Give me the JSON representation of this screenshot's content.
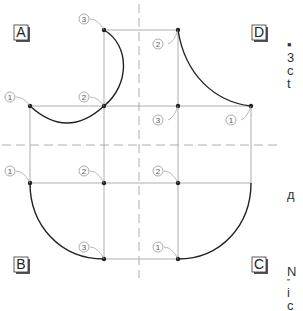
{
  "diagram": {
    "quadrant_labels": [
      {
        "id": "A",
        "x": 14,
        "y": 36
      },
      {
        "id": "B",
        "x": 14,
        "y": 268
      },
      {
        "id": "C",
        "x": 252,
        "y": 268
      },
      {
        "id": "D",
        "x": 252,
        "y": 36
      }
    ],
    "point_markers": {
      "A": [
        {
          "label": "1",
          "lx": 12,
          "ly": 97
        },
        {
          "label": "2",
          "lx": 86,
          "ly": 97
        },
        {
          "label": "3",
          "lx": 86,
          "ly": 19
        }
      ],
      "B": [
        {
          "label": "1",
          "lx": 12,
          "ly": 171
        },
        {
          "label": "2",
          "lx": 86,
          "ly": 171
        },
        {
          "label": "3",
          "lx": 86,
          "ly": 247
        }
      ],
      "C": [
        {
          "label": "1",
          "lx": 160,
          "ly": 247
        },
        {
          "label": "2",
          "lx": 160,
          "ly": 171
        }
      ],
      "D": [
        {
          "label": "1",
          "lx": 233,
          "ly": 120
        },
        {
          "label": "2",
          "lx": 160,
          "ly": 44
        },
        {
          "label": "3",
          "lx": 160,
          "ly": 120
        }
      ]
    },
    "colors": {
      "curve": "#222222",
      "grid": "#9a9a9a",
      "dash": "#9a9a9a",
      "point": "#222222"
    }
  },
  "side_text": {
    "top": [
      "▪",
      "3",
      "c",
      "t"
    ],
    "middle": [
      "д"
    ],
    "bottom": [
      "N",
      "”",
      "i",
      "c"
    ]
  }
}
